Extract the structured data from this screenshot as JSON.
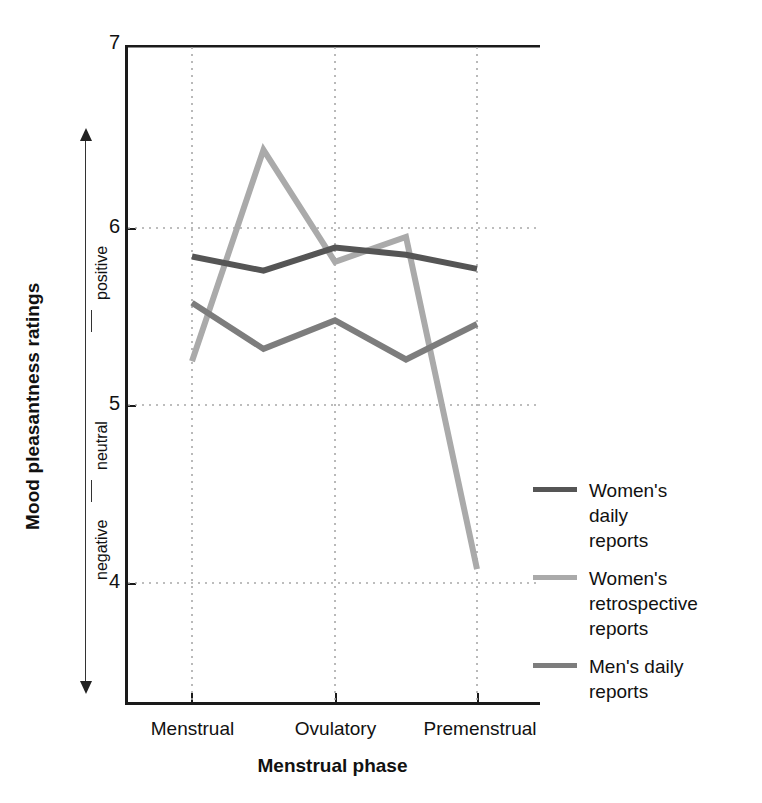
{
  "chart_data": {
    "type": "line",
    "title": "",
    "xlabel": "Menstrual phase",
    "ylabel": "Mood pleasantness ratings",
    "ylim": [
      3.3,
      7
    ],
    "yticks": [
      7,
      6,
      5,
      4
    ],
    "ytick_labels": [
      "7",
      "6",
      "5",
      "4"
    ],
    "grid": true,
    "grid_style": "dotted",
    "legend_position": "right",
    "y_axis_annotations": [
      "positive",
      "neutral",
      "negative"
    ],
    "categories": [
      "Menstrual",
      "",
      "Ovulatory",
      "",
      "Premenstrual"
    ],
    "xtick_labels": [
      "Menstrual",
      "Ovulatory",
      "Premenstrual"
    ],
    "series": [
      {
        "name": "Women's daily reports",
        "color": "#555555",
        "values": [
          5.81,
          5.73,
          5.86,
          5.82,
          5.74
        ]
      },
      {
        "name": "Women's retrospective reports",
        "color": "#aaaaaa",
        "values": [
          5.22,
          6.41,
          5.78,
          5.92,
          4.05
        ]
      },
      {
        "name": "Men's daily reports",
        "color": "#7d7d7d",
        "values": [
          5.55,
          5.29,
          5.45,
          5.23,
          5.43
        ]
      }
    ]
  },
  "axes": {
    "y_title": "Mood pleasantness ratings",
    "x_title": "Menstrual phase",
    "y_tick_7": "7",
    "y_tick_6": "6",
    "y_tick_5": "5",
    "y_tick_4": "4",
    "valence_positive": "positive",
    "valence_neutral": "neutral",
    "valence_negative": "negative",
    "x_tick_1": "Menstrual",
    "x_tick_2": "Ovulatory",
    "x_tick_3": "Premenstrual"
  },
  "legend": {
    "items": [
      {
        "label": "Women's\ndaily\nreports",
        "color": "#555555"
      },
      {
        "label": "Women's\nretrospective\nreports",
        "color": "#aaaaaa"
      },
      {
        "label": "Men's daily\nreports",
        "color": "#7d7d7d"
      }
    ]
  },
  "colors": {
    "womens_daily": "#555555",
    "womens_retrospective": "#aaaaaa",
    "mens_daily": "#7d7d7d",
    "axis": "#1a1a1a",
    "grid": "#aaaaaa",
    "background": "#ffffff"
  }
}
